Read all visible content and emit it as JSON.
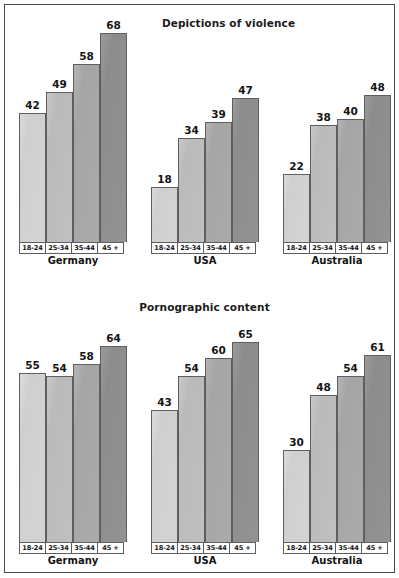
{
  "figure": {
    "background_color": "#ffffff",
    "frame_color": "#4a4a4a"
  },
  "series_colors": [
    "#d0d0d0",
    "#bcbcbc",
    "#a8a8a8",
    "#909090"
  ],
  "age_groups": [
    "18-24",
    "25-34",
    "35-44",
    "45 +"
  ],
  "countries": [
    "Germany",
    "USA",
    "Australia"
  ],
  "chart_data": [
    {
      "type": "bar",
      "title": "Depictions of violence",
      "xlabel": "",
      "ylabel": "",
      "ylim": [
        0,
        72
      ],
      "grid": false,
      "legend": "none",
      "categories": [
        "Germany",
        "USA",
        "Australia"
      ],
      "series": [
        {
          "name": "18-24",
          "values": [
            42,
            18,
            22
          ]
        },
        {
          "name": "25-34",
          "values": [
            49,
            34,
            38
          ]
        },
        {
          "name": "35-44",
          "values": [
            58,
            39,
            40
          ]
        },
        {
          "name": "45 +",
          "values": [
            68,
            47,
            48
          ]
        }
      ]
    },
    {
      "type": "bar",
      "title": "Pornographic content",
      "xlabel": "",
      "ylabel": "",
      "ylim": [
        0,
        72
      ],
      "grid": false,
      "legend": "none",
      "categories": [
        "Germany",
        "USA",
        "Australia"
      ],
      "series": [
        {
          "name": "18-24",
          "values": [
            55,
            43,
            30
          ]
        },
        {
          "name": "25-34",
          "values": [
            54,
            54,
            48
          ]
        },
        {
          "name": "35-44",
          "values": [
            58,
            60,
            54
          ]
        },
        {
          "name": "45 +",
          "values": [
            64,
            65,
            61
          ]
        }
      ]
    }
  ]
}
